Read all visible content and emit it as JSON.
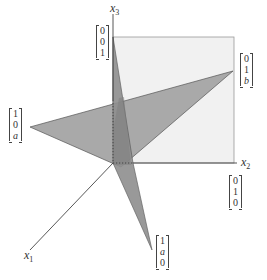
{
  "diagram": {
    "axes": {
      "x1": {
        "label": "x",
        "sub": "1"
      },
      "x2": {
        "label": "x",
        "sub": "2"
      },
      "x3": {
        "label": "x",
        "sub": "3"
      }
    },
    "vectors": {
      "e3": [
        "0",
        "0",
        "1"
      ],
      "p_10a": [
        "1",
        "0",
        "a"
      ],
      "p_01b": [
        "0",
        "1",
        "b"
      ],
      "e2": [
        "0",
        "1",
        "0"
      ],
      "p_1a0": [
        "1",
        "a",
        "0"
      ]
    },
    "colors": {
      "plane_x2x3": "#f1f1f1",
      "triangle_light": "#a9a9a9",
      "triangle_dark": "#8c8c8c",
      "axis": "#444444"
    }
  }
}
